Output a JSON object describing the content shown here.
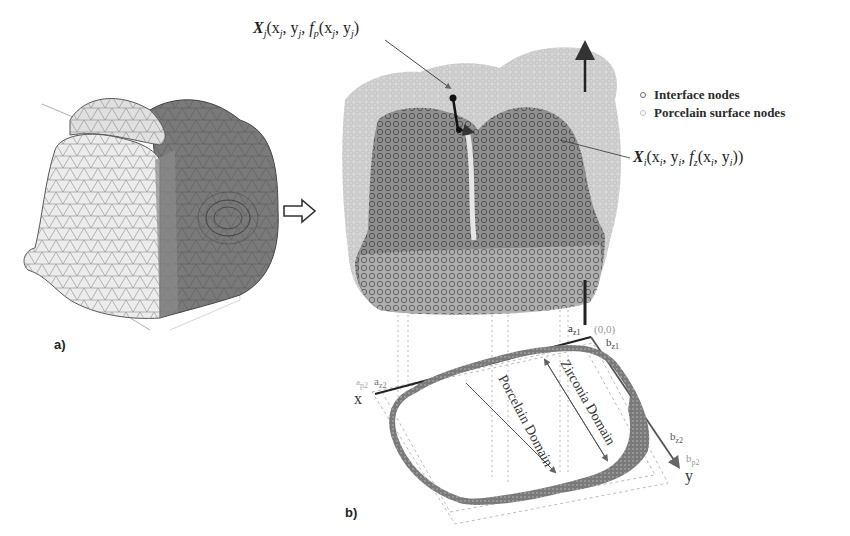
{
  "figure": {
    "panel_a": {
      "label": "a)",
      "subject": "tooth crown triangulated surface mesh"
    },
    "transition_arrow": "hollow-right-arrow",
    "panel_b": {
      "label": "b)",
      "annotations": {
        "porcelain_point": {
          "symbol": "X",
          "subscript": "j",
          "args": "(x",
          "xsub": "j",
          "comma1": ", y",
          "ysub": "j",
          "func": ", f",
          "funcsub": "p",
          "inner": "(x",
          "ixsub": "j",
          "icomma": ", y",
          "iysub": "j",
          "close": ")"
        },
        "interface_point": {
          "symbol": "X",
          "subscript": "i",
          "args": "(x",
          "xsub": "i",
          "comma1": ", y",
          "ysub": "i",
          "func": ", f",
          "funcsub": "z",
          "inner": "(x",
          "ixsub": "i",
          "icomma": ", y",
          "iysub": "i",
          "close": "))"
        }
      },
      "legend": [
        {
          "label": "Interface  nodes",
          "marker": "dark-open-circle",
          "color": "#6e6e6e"
        },
        {
          "label": "Porcelain surface nodes",
          "marker": "light-open-circle",
          "color": "#c4c4c4"
        }
      ],
      "axes": {
        "origin": "(0,0)",
        "x_label": "x",
        "y_label": "y",
        "a_z1": {
          "base": "a",
          "sub": "z1"
        },
        "b_z1": {
          "base": "b",
          "sub": "z1"
        },
        "a_z2": {
          "base": "a",
          "sub": "z2"
        },
        "a_p2": {
          "base": "a",
          "sub": "p2"
        },
        "b_z2": {
          "base": "b",
          "sub": "z2"
        },
        "b_p2": {
          "base": "b",
          "sub": "p2"
        }
      },
      "domains": {
        "porcelain": "Porcelain Domain",
        "zirconia": "Zirconia Domain"
      }
    },
    "colors": {
      "mesh_light": "#d8d8d8",
      "mesh_dark": "#6a6a6a",
      "interface_nodes": "#7a7a7a",
      "porcelain_nodes": "#cfcfcf",
      "axis": "#333333",
      "dashed": "#aaaaaa"
    }
  }
}
